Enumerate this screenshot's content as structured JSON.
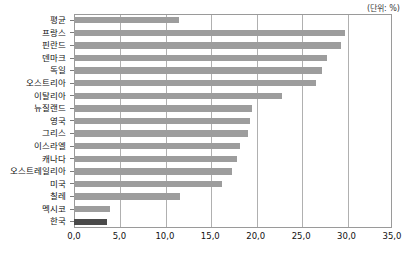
{
  "unit_note": "(단위: %)",
  "chart_data": {
    "type": "bar",
    "orientation": "horizontal",
    "title": "",
    "subtitle": "",
    "xlabel": "",
    "ylabel": "",
    "unit": "%",
    "unit_note": "(단위: %)",
    "xlim": [
      0.0,
      35.0
    ],
    "xticks": [
      "0,0",
      "5,0",
      "10,0",
      "15,0",
      "20,0",
      "25,0",
      "30,0",
      "35,0"
    ],
    "xtick_values": [
      0.0,
      5.0,
      10.0,
      15.0,
      20.0,
      25.0,
      30.0,
      35.0
    ],
    "grid": "vertical",
    "legend": "none",
    "categories": [
      "평균",
      "프랑스",
      "핀란드",
      "덴마크",
      "독일",
      "오스트리아",
      "이탈리아",
      "뉴질랜드",
      "영국",
      "그리스",
      "이스라엘",
      "캐나다",
      "오스트레일리아",
      "미국",
      "칠레",
      "멕시코",
      "한국"
    ],
    "values": [
      11.6,
      29.8,
      29.4,
      27.8,
      27.3,
      26.6,
      22.9,
      19.6,
      19.4,
      19.1,
      18.3,
      17.9,
      17.4,
      16.3,
      11.7,
      4.0,
      3.6
    ],
    "bar_color": "#9d9d9d",
    "highlight_color": "#4a4a4a",
    "highlight_categories": [
      "한국"
    ]
  }
}
